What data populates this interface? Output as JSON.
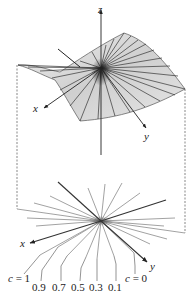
{
  "figure": {
    "upper": {
      "surface_name": "helicoid-like surface z = f(x,y) ruled by lines",
      "axes": {
        "x_label": "x",
        "y_label": "y",
        "z_label": "z"
      }
    },
    "lower": {
      "axes": {
        "x_label": "x",
        "y_label": "y"
      },
      "level_labels": [
        {
          "text": "c = 1",
          "italic_c": true
        },
        {
          "text": "0.9"
        },
        {
          "text": "0.7"
        },
        {
          "text": "0.5"
        },
        {
          "text": "0.3"
        },
        {
          "text": "0.1"
        },
        {
          "text": "c = 0",
          "italic_c": true
        }
      ]
    },
    "colors": {
      "surface_fill": "#d8d8d8",
      "ruling_lines": "#333333",
      "axis": "#222222",
      "level_lines": "#8a8a8a",
      "dashed": "#555555"
    }
  }
}
